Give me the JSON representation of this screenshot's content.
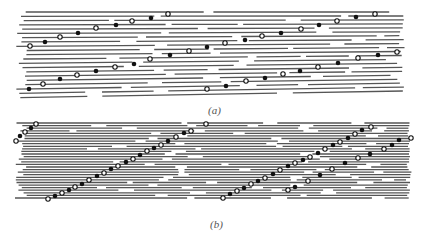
{
  "figure": {
    "panels": [
      {
        "id": "a",
        "label": "(a)",
        "label_pos": [
          208,
          112
        ],
        "line_color": "#555555",
        "line_rows": 21,
        "y_top": 12,
        "y_bottom": 91,
        "x_left": 15,
        "x_right": 405,
        "curve": 7,
        "filled_dots": [
          [
            45,
            42
          ],
          [
            78,
            33
          ],
          [
            116,
            25
          ],
          [
            151,
            18
          ],
          [
            245,
            40
          ],
          [
            281,
            33
          ],
          [
            319,
            25
          ],
          [
            356,
            17
          ],
          [
            29,
            89
          ],
          [
            60,
            79
          ],
          [
            96,
            71
          ],
          [
            134,
            64
          ],
          [
            170,
            55
          ],
          [
            207,
            47
          ],
          [
            226,
            86
          ],
          [
            265,
            78
          ],
          [
            300,
            71
          ],
          [
            338,
            63
          ],
          [
            378,
            55
          ]
        ],
        "open_dots": [
          [
            30,
            46
          ],
          [
            60,
            37
          ],
          [
            96,
            28
          ],
          [
            132,
            21
          ],
          [
            168,
            14
          ],
          [
            225,
            43
          ],
          [
            262,
            36
          ],
          [
            301,
            29
          ],
          [
            337,
            21
          ],
          [
            375,
            14
          ],
          [
            43,
            84
          ],
          [
            77,
            75
          ],
          [
            115,
            67
          ],
          [
            150,
            59
          ],
          [
            189,
            51
          ],
          [
            246,
            81
          ],
          [
            283,
            74
          ],
          [
            318,
            67
          ],
          [
            358,
            58
          ],
          [
            397,
            52
          ],
          [
            207,
            89
          ]
        ]
      },
      {
        "id": "b",
        "label": "(b)",
        "label_pos": [
          210,
          226
        ],
        "line_color": "#555555",
        "line_rows": 30,
        "y_top": 123,
        "y_bottom": 198,
        "x_left": 15,
        "x_right": 412,
        "curve": 0,
        "filled_dots": [
          [
            20,
            136
          ],
          [
            31,
            128
          ],
          [
            55,
            196
          ],
          [
            69,
            190
          ],
          [
            82,
            184
          ],
          [
            97,
            176
          ],
          [
            111,
            169
          ],
          [
            126,
            162
          ],
          [
            140,
            155
          ],
          [
            154,
            148
          ],
          [
            168,
            141
          ],
          [
            184,
            133
          ],
          [
            230,
            194
          ],
          [
            244,
            188
          ],
          [
            258,
            181
          ],
          [
            273,
            174
          ],
          [
            288,
            166
          ],
          [
            303,
            160
          ],
          [
            318,
            153
          ],
          [
            333,
            145
          ],
          [
            348,
            138
          ],
          [
            362,
            130
          ],
          [
            399,
            140
          ],
          [
            392,
            145
          ],
          [
            370,
            154
          ],
          [
            345,
            163
          ],
          [
            320,
            175
          ],
          [
            295,
            187
          ]
        ],
        "open_dots": [
          [
            16,
            141
          ],
          [
            25,
            132
          ],
          [
            36,
            124
          ],
          [
            48,
            199
          ],
          [
            62,
            193
          ],
          [
            75,
            187
          ],
          [
            89,
            180
          ],
          [
            104,
            173
          ],
          [
            118,
            166
          ],
          [
            133,
            159
          ],
          [
            147,
            151
          ],
          [
            161,
            145
          ],
          [
            176,
            137
          ],
          [
            191,
            131
          ],
          [
            206,
            124
          ],
          [
            223,
            198
          ],
          [
            237,
            191
          ],
          [
            251,
            184
          ],
          [
            265,
            178
          ],
          [
            280,
            170
          ],
          [
            295,
            163
          ],
          [
            310,
            157
          ],
          [
            325,
            149
          ],
          [
            340,
            142
          ],
          [
            355,
            134
          ],
          [
            371,
            127
          ],
          [
            384,
            149
          ],
          [
            411,
            138
          ],
          [
            358,
            158
          ],
          [
            332,
            169
          ],
          [
            308,
            181
          ],
          [
            288,
            190
          ]
        ]
      }
    ]
  }
}
